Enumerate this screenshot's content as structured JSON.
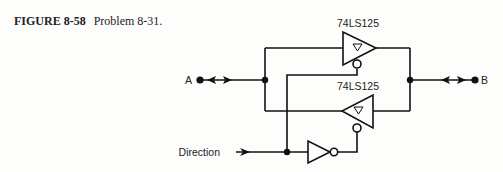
{
  "caption": {
    "figure_number": "FIGURE 8-58",
    "text": "Problem 8-31."
  },
  "diagram": {
    "top_buffer": {
      "label": "74LS125",
      "direction": "A to B",
      "enable": "active-low"
    },
    "bottom_buffer": {
      "label": "74LS125",
      "direction": "B to A",
      "enable": "active-low"
    },
    "inverter": {
      "type": "NOT gate"
    },
    "terminals": {
      "a": "A",
      "b": "B",
      "direction": "Direction"
    },
    "colors": {
      "line": "#111111",
      "background": "#fdfdfc"
    }
  }
}
